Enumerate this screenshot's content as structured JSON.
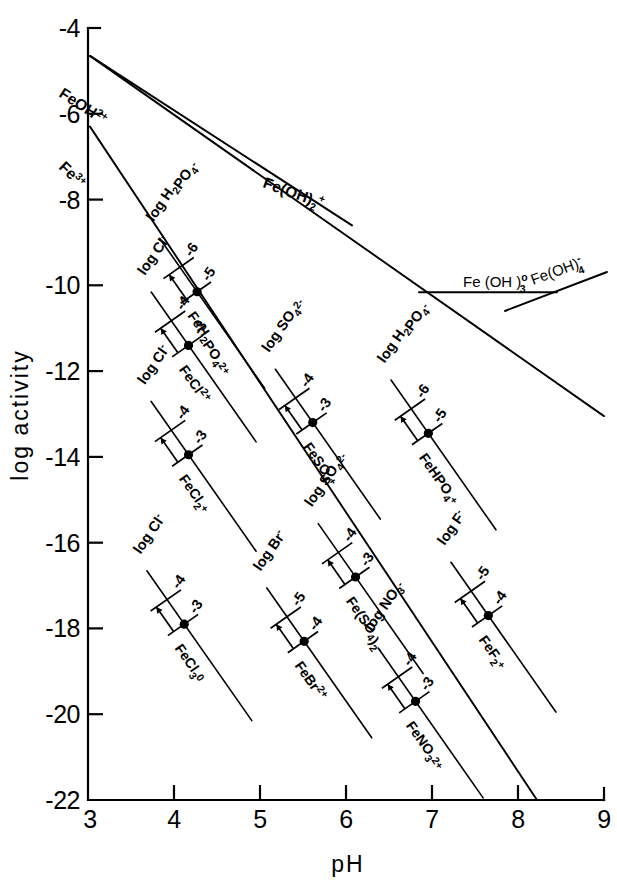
{
  "chart_data": {
    "type": "line",
    "title": "",
    "xlabel": "pH",
    "ylabel": "log activity",
    "xlim": [
      3,
      9
    ],
    "ylim": [
      -22,
      -4
    ],
    "xticks": [
      "3",
      "4",
      "5",
      "6",
      "7",
      "8",
      "9"
    ],
    "yticks": [
      "-4",
      "-6",
      "-8",
      "-10",
      "-12",
      "-14",
      "-16",
      "-18",
      "-20",
      "-22"
    ],
    "grid": false,
    "legend": "none",
    "series": [
      {
        "name": "FeOH 2+",
        "label_html": "FeOH<sup>2+</sup>",
        "points": [
          [
            3,
            -4.65
          ],
          [
            6.05,
            -8.6
          ]
        ],
        "label_x": 3.35,
        "label_y": -5.9,
        "angle": 34
      },
      {
        "name": "Fe 3+",
        "label_html": "Fe<sup>3+</sup>",
        "points": [
          [
            3,
            -6.3
          ],
          [
            8.2,
            -22.0
          ]
        ],
        "label_x": 3.35,
        "label_y": -7.6,
        "angle": 51
      },
      {
        "name": "Fe(OH)2 +",
        "label_html": "Fe(OH)<sub>2</sub><sup>+</sup>",
        "points": [
          [
            3,
            -4.65
          ],
          [
            8.7,
            -13.0
          ]
        ],
        "label_x": 5.35,
        "label_y": -7.85,
        "angle": 20
      },
      {
        "name": "Fe(OH)3 0",
        "label_html": "Fe(OH)<sub>3</sub><sup>0</sup>",
        "points": [
          [
            6.85,
            -10.15
          ],
          [
            8.45,
            -10.15
          ]
        ],
        "label_x": 7.25,
        "label_y": -9.65,
        "angle": 0
      },
      {
        "name": "Fe(OH)4 -",
        "label_html": "Fe(OH)<sub>4</sub><sup>-</sup>",
        "points": [
          [
            7.85,
            -10.6
          ],
          [
            9.0,
            -9.75
          ]
        ],
        "label_x": 8.25,
        "label_y": -9.6,
        "angle": -20
      }
    ],
    "complexes": [
      {
        "name": "FeH2PO4 2+",
        "label_html": "FeH<sub>2</sub>PO<sub>4</sub><sup>2+</sup>",
        "ligand_label": "log H₂PO₄⁻",
        "ligand_html": "log H<sub>2</sub>PO<sub>4</sub><sup>-</sup>",
        "scale_low": "-6",
        "scale_high": "-5",
        "dot_ph": 4.25,
        "dot_y": -10.15
      },
      {
        "name": "FeCl 2+",
        "label_html": "FeCl<sup>2+</sup>",
        "ligand_label": "log Cl⁻",
        "ligand_html": "log Cl<sup>-</sup>",
        "scale_low": "-4",
        "scale_high": "-3",
        "dot_ph": 4.15,
        "dot_y": -11.4
      },
      {
        "name": "FeCl2 +",
        "label_html": "FeCl<sub>2</sub><sup>+</sup>",
        "ligand_label": "log Cl⁻",
        "ligand_html": "log Cl<sup>-</sup>",
        "scale_low": "-4",
        "scale_high": "-3",
        "dot_ph": 4.15,
        "dot_y": -13.95
      },
      {
        "name": "FeCl3 0",
        "label_html": "FeCl<sub>3</sub><sup>0</sup>",
        "ligand_label": "log Cl⁻",
        "ligand_html": "log Cl<sup>-</sup>",
        "scale_low": "-4",
        "scale_high": "-3",
        "dot_ph": 4.1,
        "dot_y": -17.9
      },
      {
        "name": "FeSO4 +",
        "label_html": "FeSO<sub>4</sub><sup>+</sup>",
        "ligand_label": "log SO₄²⁻",
        "ligand_html": "log SO<sub>4</sub><sup>2-</sup>",
        "scale_low": "-4",
        "scale_high": "-3",
        "dot_ph": 5.6,
        "dot_y": -13.2
      },
      {
        "name": "Fe(SO4)2 -",
        "label_html": "Fe(SO<sub>4</sub>)<sub>2</sub><sup>-</sup>",
        "ligand_label": "log SO₄²⁻",
        "ligand_html": "log SO<sub>4</sub><sup>2-</sup>",
        "scale_low": "-4",
        "scale_high": "-3",
        "dot_ph": 6.1,
        "dot_y": -16.8
      },
      {
        "name": "FeBr 2+",
        "label_html": "FeBr<sup>2+</sup>",
        "ligand_label": "log Br⁻",
        "ligand_html": "log Br<sup>-</sup>",
        "scale_low": "-5",
        "scale_high": "-4",
        "dot_ph": 5.5,
        "dot_y": -18.3
      },
      {
        "name": "FeNO3 2+",
        "label_html": "FeNO<sub>3</sub><sup>2+</sup>",
        "ligand_label": "log NO₃⁻",
        "ligand_html": "log NO<sub>3</sub><sup>-</sup>",
        "scale_low": "-4",
        "scale_high": "-3",
        "dot_ph": 6.8,
        "dot_y": -19.7
      },
      {
        "name": "FeHPO4 +",
        "label_html": "FeHPO<sub>4</sub><sup>+</sup>",
        "ligand_label": "log H₂PO₄⁻",
        "ligand_html": "log H<sub>2</sub>PO<sub>4</sub><sup>-</sup>",
        "scale_low": "-6",
        "scale_high": "-5",
        "dot_ph": 6.95,
        "dot_y": -13.45
      },
      {
        "name": "FeF2 +",
        "label_html": "FeF<sub>2</sub><sup>+</sup>",
        "ligand_label": "log F⁻",
        "ligand_html": "log F<sup>-</sup>",
        "scale_low": "-5",
        "scale_high": "-4",
        "dot_ph": 7.65,
        "dot_y": -17.7
      }
    ]
  },
  "axes": {
    "x_title": "pH",
    "y_title": "log activity",
    "x_tick_labels": [
      "3",
      "4",
      "5",
      "6",
      "7",
      "8",
      "9"
    ],
    "y_tick_labels": [
      "-4",
      "-6",
      "-8",
      "-10",
      "-12",
      "-14",
      "-16",
      "-18",
      "-20",
      "-22"
    ]
  },
  "species_labels": {
    "feoh2p": "FeOH",
    "feoh2p_sup": "2+",
    "fe3p": "Fe",
    "fe3p_sup": "3+",
    "feoh2_plus": "Fe(OH)",
    "feoh2_plus_sub": "2",
    "feoh2_plus_sup": "+",
    "feoh3_0": "Fe (OH )",
    "feoh3_0_sub": "3",
    "feoh3_0_sup": "o",
    "feoh4_m": "Fe(OH)",
    "feoh4_m_sub": "4",
    "feoh4_m_sup": "-"
  }
}
